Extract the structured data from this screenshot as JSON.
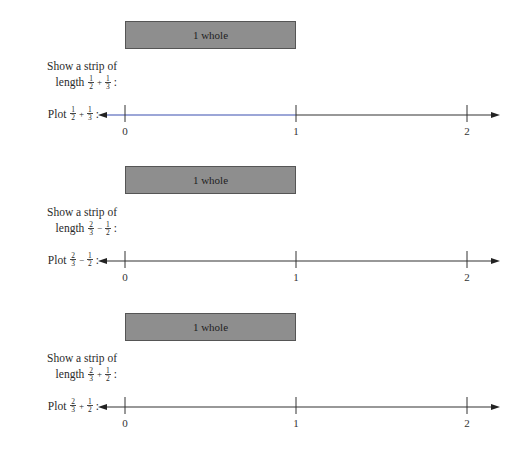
{
  "sections": [
    {
      "bar_label": "1 whole",
      "prompt_line1": "Show a strip of",
      "prompt_line2": "length",
      "expression": {
        "a_num": "1",
        "a_den": "2",
        "op": "+",
        "b_num": "1",
        "b_den": "3"
      },
      "plot_word": "Plot",
      "colon": ":",
      "line_color": "#3a4fb0",
      "ticks": [
        "0",
        "1",
        "2"
      ]
    },
    {
      "bar_label": "1 whole",
      "prompt_line1": "Show a strip of",
      "prompt_line2": "length",
      "expression": {
        "a_num": "2",
        "a_den": "3",
        "op": "−",
        "b_num": "1",
        "b_den": "2"
      },
      "plot_word": "Plot",
      "colon": ":",
      "line_color": "#333333",
      "ticks": [
        "0",
        "1",
        "2"
      ]
    },
    {
      "bar_label": "1 whole",
      "prompt_line1": "Show a strip of",
      "prompt_line2": "length",
      "expression": {
        "a_num": "2",
        "a_den": "3",
        "op": "+",
        "b_num": "1",
        "b_den": "2"
      },
      "plot_word": "Plot",
      "colon": ":",
      "line_color": "#333333",
      "ticks": [
        "0",
        "1",
        "2"
      ]
    }
  ],
  "colors": {
    "bar_fill": "#8e8e8e",
    "bar_border": "#555555",
    "text": "#2a2a2a"
  }
}
